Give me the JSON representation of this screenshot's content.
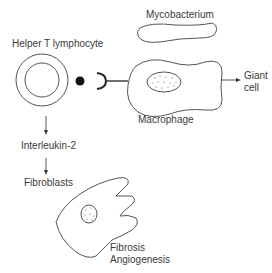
{
  "diagram": {
    "labels": {
      "helper_t": "Helper T lymphocyte",
      "mycobacterium": "Mycobacterium",
      "macrophage": "Macrophage",
      "giant_cell_line1": "Giant",
      "giant_cell_line2": "cell",
      "interleukin": "Interleukin-2",
      "fibroblasts": "Fibroblasts",
      "fibrosis": "Fibrosis",
      "angiogenesis": "Angiogenesis"
    },
    "colors": {
      "stroke": "#555555",
      "text": "#3a3a3a",
      "dot": "#111111"
    }
  }
}
